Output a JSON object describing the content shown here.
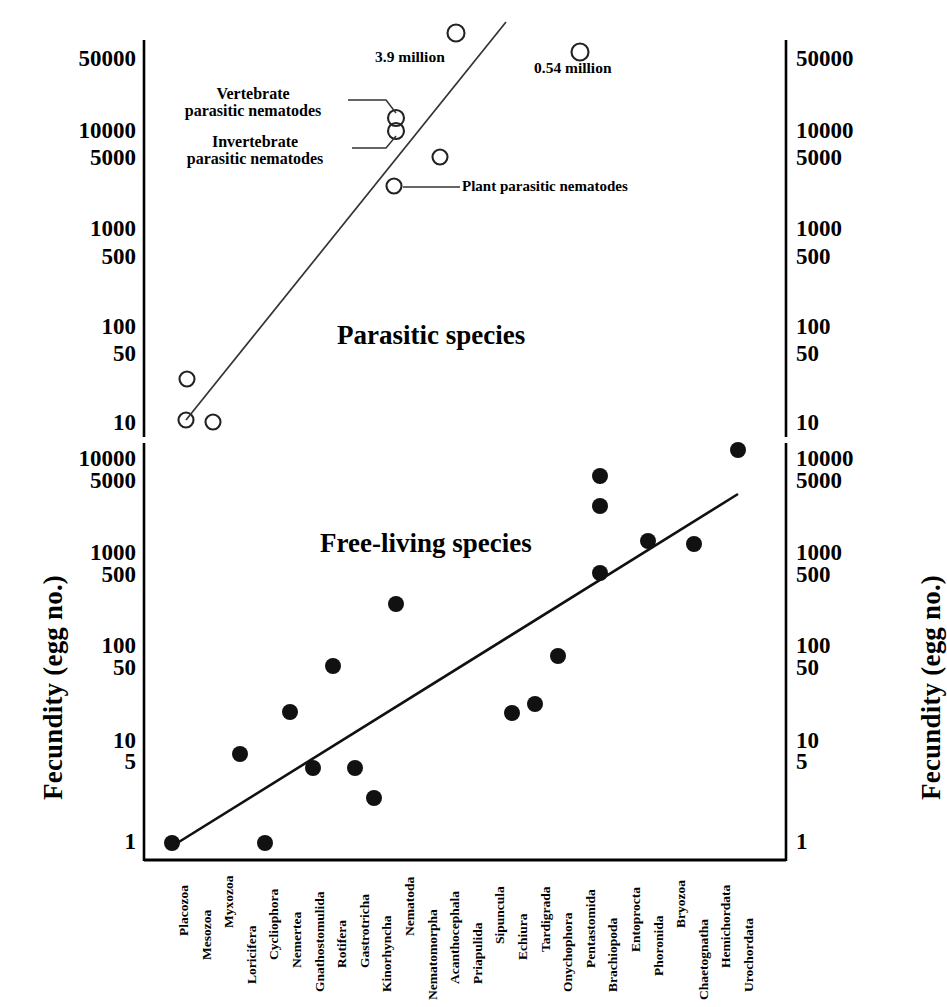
{
  "axes": {
    "y_label_left": "Fecundity (egg no.)",
    "y_label_right": "Fecundity (egg no.)",
    "upper_ticks": [
      "50000",
      "10000",
      "5000",
      "1000",
      "500",
      "100",
      "50",
      "10"
    ],
    "lower_ticks": [
      "10000",
      "5000",
      "1000",
      "500",
      "100",
      "50",
      "10",
      "5",
      "1"
    ],
    "categories": [
      "Placozoa",
      "Mesozoa",
      "Myxozoa",
      "Loricifera",
      "Cycliophora",
      "Nemertea",
      "Gnathostomulida",
      "Rotifera",
      "Gastrotricha",
      "Kinorhyncha",
      "Nematoda",
      "Nematomorpha",
      "Acanthocephala",
      "Priapulida",
      "Sipuncula",
      "Echiura",
      "Tardigrada",
      "Onychophora",
      "Pentastomida",
      "Brachiopoda",
      "Entoprocta",
      "Phoronida",
      "Bryozoa",
      "Chaetognatha",
      "Hemichordata",
      "Urochordata"
    ]
  },
  "annotations": {
    "region_upper": "Parasitic species",
    "region_lower": "Free-living species",
    "vertebrate_line1": "Vertebrate",
    "vertebrate_line2": "parasitic nematodes",
    "invertebrate_line1": "Invertebrate",
    "invertebrate_line2": "parasitic nematodes",
    "plant_parasitic": "Plant parasitic nematodes",
    "million_39": "3.9 million",
    "million_054": "0.54 million"
  },
  "chart_data": {
    "type": "scatter",
    "title": "",
    "xlabel": "",
    "ylabel": "Fecundity (egg no.)",
    "grid": false,
    "legend_position": "none",
    "panels": [
      {
        "name": "parasitic",
        "label": "Parasitic species",
        "marker": "open-circle",
        "ylim": [
          7,
          5000000
        ],
        "yticks": [
          10,
          50,
          100,
          500,
          1000,
          5000,
          10000,
          50000
        ],
        "points": [
          {
            "category": "Mesozoa",
            "value": 35
          },
          {
            "category": "Mesozoa",
            "value": 11
          },
          {
            "category": "Myxozoa",
            "value": 10
          },
          {
            "category": "Gnathostomulida",
            "value": 3000,
            "note": "Plant parasitic nematodes"
          },
          {
            "category": "Gnathostomulida",
            "value": 14000,
            "note": "Vertebrate parasitic nematodes"
          },
          {
            "category": "Gnathostomulida",
            "value": 11000,
            "note": "Invertebrate parasitic nematodes"
          },
          {
            "category": "Rotifera",
            "value": 5000
          },
          {
            "category": "Gnathostomulida",
            "value": 3900000,
            "label": "3.9 million"
          },
          {
            "category": "Nematomorpha",
            "value": 540000,
            "label": "0.54 million"
          }
        ],
        "trendline": {
          "from": {
            "x": 1.0,
            "y": 11
          },
          "to": {
            "x": 11.3,
            "y": 200000
          }
        }
      },
      {
        "name": "free-living",
        "label": "Free-living species",
        "marker": "filled-circle",
        "ylim": [
          0.8,
          20000
        ],
        "yticks": [
          1,
          5,
          10,
          50,
          100,
          500,
          1000,
          5000,
          10000
        ],
        "points": [
          {
            "category": "Placozoa",
            "value": 1
          },
          {
            "category": "Loricifera",
            "value": 9
          },
          {
            "category": "Cycliophora",
            "value": 1
          },
          {
            "category": "Nemertea",
            "value": 30
          },
          {
            "category": "Gnathostomulida",
            "value": 6
          },
          {
            "category": "Rotifera",
            "value": 40
          },
          {
            "category": "Gastrotricha",
            "value": 6
          },
          {
            "category": "Kinorhyncha",
            "value": 3
          },
          {
            "category": "Nematoda",
            "value": 300
          },
          {
            "category": "Echiura",
            "value": 28
          },
          {
            "category": "Tardigrada",
            "value": 33
          },
          {
            "category": "Onychophora",
            "value": 45
          },
          {
            "category": "Pentastomida",
            "value": 500
          },
          {
            "category": "Brachiopoda",
            "value": 3500
          },
          {
            "category": "Brachiopoda",
            "value": 6000
          },
          {
            "category": "Phoronida",
            "value": 600
          },
          {
            "category": "Hemichordata",
            "value": 1400
          },
          {
            "category": "Urochordata",
            "value": 13000
          }
        ],
        "trendline": {
          "from": {
            "x": 0.05,
            "y": 0.85
          },
          "to": {
            "x": 19.9,
            "y": 2400
          }
        }
      }
    ]
  }
}
